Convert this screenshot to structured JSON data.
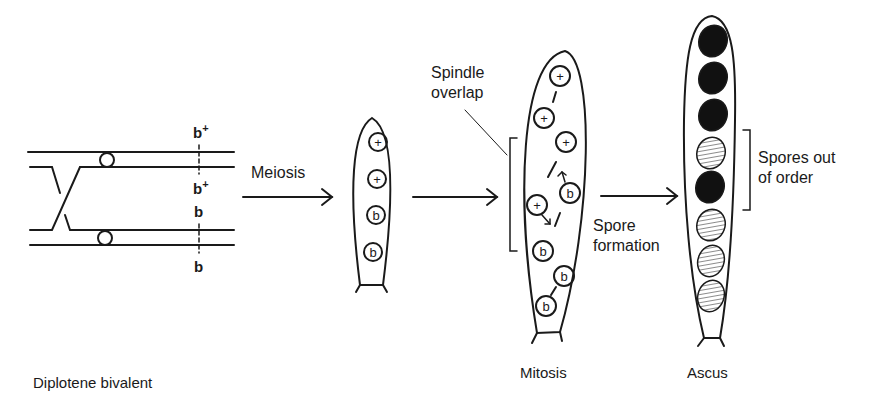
{
  "diagram": {
    "title": "",
    "stages": [
      {
        "id": "bivalent",
        "label": "Diplotene bivalent"
      },
      {
        "id": "meiosis",
        "label": "Meiosis"
      },
      {
        "id": "mitosis",
        "label": "Mitosis"
      },
      {
        "id": "ascus",
        "label": "Ascus"
      }
    ],
    "arrows": [
      {
        "label": "Meiosis"
      },
      {
        "label": ""
      },
      {
        "label": "Spore formation"
      }
    ],
    "genes": {
      "top1": "b",
      "top1_sup": "+",
      "top2": "b",
      "top2_sup": "+",
      "bottom1": "b",
      "bottom2": "b"
    },
    "meiosis_spores": [
      "+",
      "+",
      "b",
      "b"
    ],
    "mitosis_spores": [
      "+",
      "+",
      "+",
      "b",
      "+",
      "b",
      "b",
      "b"
    ],
    "ascus_spores": [
      "black",
      "black",
      "black",
      "hatched",
      "black",
      "hatched",
      "hatched",
      "hatched"
    ],
    "annotations": {
      "spindle_line1": "Spindle",
      "spindle_line2": "overlap",
      "spore_formation_line1": "Spore",
      "spore_formation_line2": "formation",
      "out_of_order_line1": "Spores out",
      "out_of_order_line2": "of order"
    },
    "labels": {
      "bivalent": "Diplotene bivalent",
      "mitosis": "Mitosis",
      "ascus": "Ascus"
    },
    "colors": {
      "ink": "#1a1a1a",
      "background": "#ffffff"
    }
  }
}
